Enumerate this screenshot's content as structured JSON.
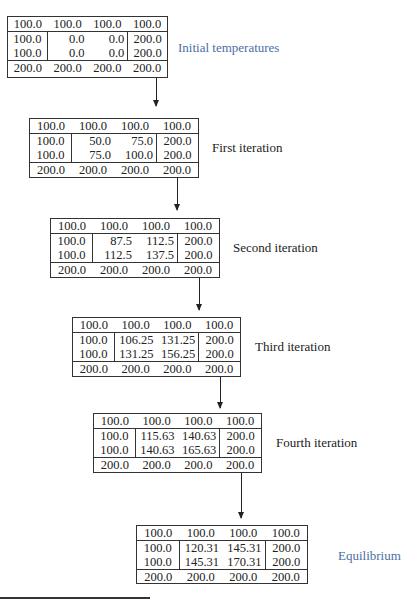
{
  "stages": [
    {
      "label": "Initial temperatures",
      "top": [
        "100.0",
        "100.0",
        "100.0",
        "100.0"
      ],
      "interior": [
        [
          "100.0",
          "0.0",
          "0.0",
          "200.0"
        ],
        [
          "100.0",
          "0.0",
          "0.0",
          "200.0"
        ]
      ],
      "bottom": [
        "200.0",
        "200.0",
        "200.0",
        "200.0"
      ]
    },
    {
      "label": "First iteration",
      "top": [
        "100.0",
        "100.0",
        "100.0",
        "100.0"
      ],
      "interior": [
        [
          "100.0",
          "50.0",
          "75.0",
          "200.0"
        ],
        [
          "100.0",
          "75.0",
          "100.0",
          "200.0"
        ]
      ],
      "bottom": [
        "200.0",
        "200.0",
        "200.0",
        "200.0"
      ]
    },
    {
      "label": "Second iteration",
      "top": [
        "100.0",
        "100.0",
        "100.0",
        "100.0"
      ],
      "interior": [
        [
          "100.0",
          "87.5",
          "112.5",
          "200.0"
        ],
        [
          "100.0",
          "112.5",
          "137.5",
          "200.0"
        ]
      ],
      "bottom": [
        "200.0",
        "200.0",
        "200.0",
        "200.0"
      ]
    },
    {
      "label": "Third iteration",
      "top": [
        "100.0",
        "100.0",
        "100.0",
        "100.0"
      ],
      "interior": [
        [
          "100.0",
          "106.25",
          "131.25",
          "200.0"
        ],
        [
          "100.0",
          "131.25",
          "156.25",
          "200.0"
        ]
      ],
      "bottom": [
        "200.0",
        "200.0",
        "200.0",
        "200.0"
      ]
    },
    {
      "label": "Fourth iteration",
      "top": [
        "100.0",
        "100.0",
        "100.0",
        "100.0"
      ],
      "interior": [
        [
          "100.0",
          "115.63",
          "140.63",
          "200.0"
        ],
        [
          "100.0",
          "140.63",
          "165.63",
          "200.0"
        ]
      ],
      "bottom": [
        "200.0",
        "200.0",
        "200.0",
        "200.0"
      ]
    },
    {
      "label": "Equilibrium",
      "top": [
        "100.0",
        "100.0",
        "100.0",
        "100.0"
      ],
      "interior": [
        [
          "100.0",
          "120.31",
          "145.31",
          "200.0"
        ],
        [
          "100.0",
          "145.31",
          "170.31",
          "200.0"
        ]
      ],
      "bottom": [
        "200.0",
        "200.0",
        "200.0",
        "200.0"
      ]
    }
  ],
  "colors": {
    "label_highlight": "#4a6fa5",
    "label_default": "#222222",
    "border": "#333333"
  }
}
